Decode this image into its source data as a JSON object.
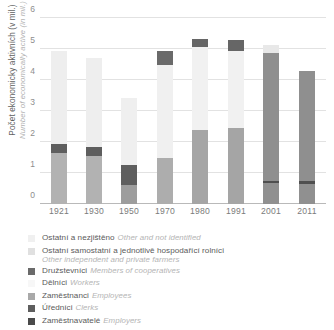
{
  "axis": {
    "y_title_cz": "Počet ekonomicky aktivních (v mil.)",
    "y_title_en": "Number of economically active (in mil.)",
    "y_ticks": [
      "0",
      "1",
      "2",
      "3",
      "4",
      "5",
      "6"
    ]
  },
  "legend": [
    {
      "label_cz": "Ostatní a nezjištěno",
      "label_en": "Other and not identified",
      "color": "#f0f0f0",
      "wrap": false
    },
    {
      "label_cz": "Ostatní samostatní a jednotlivě hospodařící rolníci",
      "label_en": "Other independent and private farmers",
      "color": "#e0e0e0",
      "wrap": true
    },
    {
      "label_cz": "Družstevníci",
      "label_en": "Members of cooperatives",
      "color": "#6a6a6a",
      "wrap": false
    },
    {
      "label_cz": "Dělníci",
      "label_en": "Workers",
      "color": "#f7f7f7",
      "wrap": false
    },
    {
      "label_cz": "Zaměstnanci",
      "label_en": "Employees",
      "color": "#a9a9a9",
      "wrap": false
    },
    {
      "label_cz": "Úředníci",
      "label_en": "Clerks",
      "color": "#5e5e5e",
      "wrap": false
    },
    {
      "label_cz": "Zaměstnavatelé",
      "label_en": "Employers",
      "color": "#4a4a4a",
      "wrap": false
    }
  ],
  "chart_data": {
    "type": "bar",
    "stacked": true,
    "title": "",
    "xlabel": "",
    "ylabel": "Počet ekonomicky aktivních (v mil.) / Number of economically active (in mil.)",
    "ylim": [
      0,
      6
    ],
    "yticks": [
      0,
      1,
      2,
      3,
      4,
      5,
      6
    ],
    "grid": true,
    "legend_position": "below",
    "categories": [
      "1921",
      "1930",
      "1950",
      "1970",
      "1980",
      "1991",
      "2001",
      "2011"
    ],
    "series": [
      {
        "name": "Dělníci / Workers",
        "color": "#b0b0b0",
        "values": [
          1.65,
          1.55,
          0.62,
          1.5,
          2.4,
          2.45,
          0.0,
          0.0
        ]
      },
      {
        "name": "Zaměstnavatelé / Employers",
        "color": "#4a4a4a",
        "values": [
          0.0,
          0.0,
          0.0,
          0.0,
          0.0,
          0.0,
          0.68,
          0.66
        ]
      },
      {
        "name": "Úředníci / Clerks",
        "color": "#5e5e5e",
        "values": [
          0.28,
          0.28,
          0.63,
          0.0,
          0.0,
          0.0,
          0.07,
          0.07
        ]
      },
      {
        "name": "Zaměstnanci / Employees",
        "color": "#a9a9a9",
        "values": [
          0.0,
          0.0,
          0.0,
          0.0,
          0.0,
          0.0,
          4.13,
          3.57
        ]
      },
      {
        "name": "Ostatní samostatní a jednotlivě hospodařící rolníci / Other independent and private farmers",
        "color": "#e4e4e4",
        "values": [
          3.02,
          2.89,
          2.18,
          2.98,
          2.68,
          2.48,
          0.0,
          0.0
        ]
      },
      {
        "name": "Družstevníci / Members of cooperatives",
        "color": "#6a6a6a",
        "values": [
          0.0,
          0.0,
          0.0,
          0.45,
          0.24,
          0.35,
          0.0,
          0.0
        ]
      },
      {
        "name": "Ostatní a nezjištěno / Other and not identified",
        "color": "#f0f0f0",
        "values": [
          0.0,
          0.0,
          0.0,
          0.0,
          0.0,
          0.0,
          0.24,
          0.0
        ]
      }
    ],
    "totals": [
      4.95,
      4.72,
      3.43,
      4.93,
      5.32,
      5.28,
      5.12,
      4.3
    ]
  },
  "bars": [
    {
      "year": "1921",
      "x": 11,
      "segments": [
        {
          "name": "workers",
          "y0": 0.0,
          "y1": 1.65,
          "color": "#b2b2b2"
        },
        {
          "name": "clerks",
          "y0": 1.65,
          "y1": 1.93,
          "color": "#5e5e5e"
        },
        {
          "name": "farmers",
          "y0": 1.93,
          "y1": 4.95,
          "color": "#eeeeee"
        }
      ]
    },
    {
      "year": "1930",
      "x": 46,
      "segments": [
        {
          "name": "workers",
          "y0": 0.0,
          "y1": 1.55,
          "color": "#b2b2b2"
        },
        {
          "name": "clerks",
          "y0": 1.55,
          "y1": 1.83,
          "color": "#5e5e5e"
        },
        {
          "name": "farmers",
          "y0": 1.83,
          "y1": 4.72,
          "color": "#eeeeee"
        }
      ]
    },
    {
      "year": "1950",
      "x": 81,
      "segments": [
        {
          "name": "workers",
          "y0": 0.0,
          "y1": 0.62,
          "color": "#9d9d9d"
        },
        {
          "name": "clerks",
          "y0": 0.62,
          "y1": 1.25,
          "color": "#5e5e5e"
        },
        {
          "name": "farmers",
          "y0": 1.25,
          "y1": 3.43,
          "color": "#efefef"
        }
      ]
    },
    {
      "year": "1970",
      "x": 117,
      "segments": [
        {
          "name": "workers",
          "y0": 0.0,
          "y1": 1.5,
          "color": "#adadad"
        },
        {
          "name": "farmers",
          "y0": 1.5,
          "y1": 4.48,
          "color": "#f0f0f0"
        },
        {
          "name": "coops",
          "y0": 4.48,
          "y1": 4.93,
          "color": "#6a6a6a"
        }
      ]
    },
    {
      "year": "1980",
      "x": 152,
      "segments": [
        {
          "name": "workers",
          "y0": 0.0,
          "y1": 2.4,
          "color": "#a5a5a5"
        },
        {
          "name": "farmers",
          "y0": 2.4,
          "y1": 5.08,
          "color": "#f1f1f1"
        },
        {
          "name": "coops",
          "y0": 5.08,
          "y1": 5.32,
          "color": "#666666"
        }
      ]
    },
    {
      "year": "1991",
      "x": 188,
      "segments": [
        {
          "name": "workers",
          "y0": 0.0,
          "y1": 2.45,
          "color": "#a5a5a5"
        },
        {
          "name": "farmers",
          "y0": 2.45,
          "y1": 4.93,
          "color": "#f1f1f1"
        },
        {
          "name": "coops",
          "y0": 4.93,
          "y1": 5.28,
          "color": "#666666"
        }
      ]
    },
    {
      "year": "2001",
      "x": 223,
      "segments": [
        {
          "name": "employers",
          "y0": 0.0,
          "y1": 0.68,
          "color": "#909090"
        },
        {
          "name": "clerks",
          "y0": 0.68,
          "y1": 0.75,
          "color": "#4f4f4f"
        },
        {
          "name": "employees",
          "y0": 0.75,
          "y1": 4.88,
          "color": "#8f8f8f"
        },
        {
          "name": "other",
          "y0": 4.88,
          "y1": 5.12,
          "color": "#e8e8e8"
        }
      ]
    },
    {
      "year": "2011",
      "x": 259,
      "segments": [
        {
          "name": "employers",
          "y0": 0.0,
          "y1": 0.66,
          "color": "#909090"
        },
        {
          "name": "clerks",
          "y0": 0.66,
          "y1": 0.73,
          "color": "#4f4f4f"
        },
        {
          "name": "employees",
          "y0": 0.73,
          "y1": 4.3,
          "color": "#8f8f8f"
        }
      ]
    }
  ]
}
